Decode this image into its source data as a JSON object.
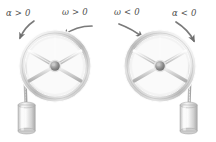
{
  "figure": {
    "background_color": "#ffffff",
    "ink_color": "#4d4d4d",
    "metal_light": "#f2f2f2",
    "metal_mid": "#cfcfcf",
    "metal_dark": "#9a9a9a"
  },
  "panels": [
    {
      "id": "left-panel",
      "name": "counterclockwise-pulley",
      "rotation_sense": "counterclockwise",
      "weight_side": "left",
      "labels": [
        {
          "id": "alpha-positive",
          "symbol": "α",
          "operator": ">",
          "value": "0",
          "text": "α > 0",
          "x": 6,
          "y": 15
        },
        {
          "id": "omega-positive",
          "symbol": "ω",
          "operator": ">",
          "value": "0",
          "text": "ω > 0",
          "x": 62,
          "y": 14
        }
      ],
      "arrows": [
        {
          "id": "alpha-arrow-left",
          "direction": "counterclockwise-down-left"
        },
        {
          "id": "omega-arrow-right",
          "direction": "counterclockwise-up-left"
        }
      ],
      "wheel": {
        "cx": 55,
        "cy": 66,
        "r_outer": 33,
        "r_inner": 27,
        "spokes": 6,
        "hub_r": 5
      },
      "weight": {
        "shape": "cylinder",
        "x": 18,
        "y": 104,
        "w": 17,
        "h": 27
      },
      "rope": {
        "from_x": 24,
        "from_y": 66,
        "to_x": 26,
        "to_y": 104
      }
    },
    {
      "id": "right-panel",
      "name": "clockwise-pulley",
      "rotation_sense": "clockwise",
      "weight_side": "right",
      "labels": [
        {
          "id": "omega-negative",
          "symbol": "ω",
          "operator": "<",
          "value": "0",
          "text": "ω < 0",
          "x": 114,
          "y": 14
        },
        {
          "id": "alpha-negative",
          "symbol": "α",
          "operator": "<",
          "value": "0",
          "text": "α < 0",
          "x": 172,
          "y": 15
        }
      ],
      "arrows": [
        {
          "id": "omega-arrow-left",
          "direction": "clockwise-down-right"
        },
        {
          "id": "alpha-arrow-right",
          "direction": "clockwise-down-right"
        }
      ],
      "wheel": {
        "cx": 160,
        "cy": 66,
        "r_outer": 33,
        "r_inner": 27,
        "spokes": 6,
        "hub_r": 5
      },
      "weight": {
        "shape": "cylinder",
        "x": 180,
        "y": 104,
        "w": 17,
        "h": 27
      },
      "rope": {
        "from_x": 191,
        "from_y": 66,
        "to_x": 189,
        "to_y": 104
      }
    }
  ]
}
